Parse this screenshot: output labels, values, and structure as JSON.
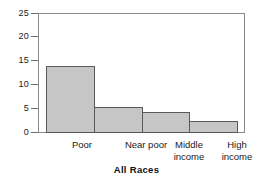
{
  "chart_data": {
    "type": "bar",
    "title": "",
    "subtitle": "",
    "xlabel": "All Races",
    "ylabel": "",
    "categories": [
      "Poor",
      "Near poor",
      "Middle\nincome",
      "High\nincome"
    ],
    "values": [
      14.0,
      5.4,
      4.4,
      2.5
    ],
    "ylim": [
      0,
      25
    ],
    "yticks": [
      0,
      5,
      10,
      15,
      20,
      25
    ],
    "ytick_labels": [
      "0",
      "5",
      "10",
      "15",
      "20",
      "25"
    ],
    "grid": false,
    "legend": null,
    "bar_fill_color": "#c6c6c6",
    "bar_edge_color": "#595959",
    "frame_color": "#8a8a8a",
    "bars_contiguous": true
  },
  "axis": {
    "x_title": "All Races"
  }
}
